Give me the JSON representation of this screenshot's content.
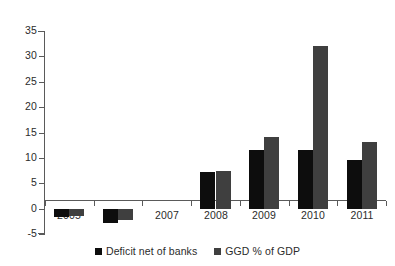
{
  "chart_data": {
    "type": "bar",
    "title": "",
    "xlabel": "",
    "ylabel": "",
    "categories": [
      "2005",
      "2006",
      "2007",
      "2008",
      "2009",
      "2010",
      "2011"
    ],
    "series": [
      {
        "name": "Deficit net of banks",
        "color": "#0d0d0d",
        "values": [
          -1.5,
          -2.7,
          0,
          7.3,
          11.6,
          11.6,
          9.6
        ]
      },
      {
        "name": "GGD % of GDP",
        "color": "#3f3f3f",
        "values": [
          -1.4,
          -2.2,
          0,
          7.4,
          14.2,
          32.1,
          13.2
        ]
      }
    ],
    "ylim": [
      -5,
      35
    ],
    "yticks": [
      -5,
      0,
      5,
      10,
      15,
      20,
      25,
      30,
      35
    ],
    "ytick_labels": [
      "-5",
      "0",
      "5",
      "10",
      "15",
      "20",
      "25",
      "30",
      "35"
    ],
    "grid": false,
    "legend_position": "bottom"
  },
  "axes": {
    "y_ticks": [
      {
        "label": "35",
        "value": 35
      },
      {
        "label": "30",
        "value": 30
      },
      {
        "label": "25",
        "value": 25
      },
      {
        "label": "20",
        "value": 20
      },
      {
        "label": "15",
        "value": 15
      },
      {
        "label": "10",
        "value": 10
      },
      {
        "label": "5",
        "value": 5
      },
      {
        "label": "0",
        "value": 0
      },
      {
        "label": "-5",
        "value": -5
      }
    ],
    "x_ticks": [
      {
        "label": "2005"
      },
      {
        "label": "2006"
      },
      {
        "label": "2007"
      },
      {
        "label": "2008"
      },
      {
        "label": "2009"
      },
      {
        "label": "2010"
      },
      {
        "label": "2011"
      }
    ]
  },
  "legend": {
    "items": [
      {
        "label": "Deficit net of banks",
        "color": "#0d0d0d"
      },
      {
        "label": "GGD % of GDP",
        "color": "#3f3f3f"
      }
    ]
  }
}
